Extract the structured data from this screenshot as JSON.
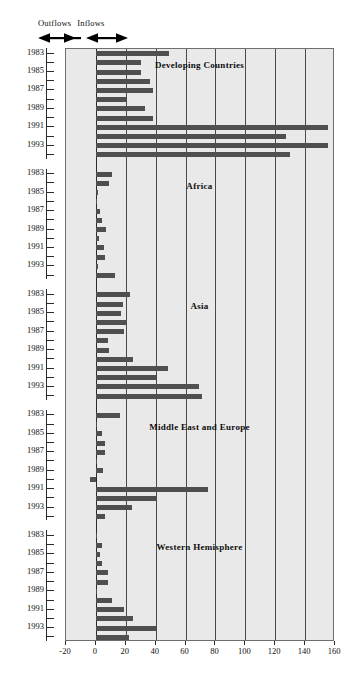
{
  "legend": {
    "outflows_label": "Outflows",
    "inflows_label": "Inflows",
    "left_arrow_icon": "arrow-left-icon",
    "right_arrow_icon": "arrow-right-icon"
  },
  "chart_data": {
    "type": "bar",
    "orientation": "horizontal",
    "title": "",
    "xlabel": "",
    "ylabel": "",
    "xlim": [
      -20,
      160
    ],
    "xticks": [
      -20,
      0,
      20,
      40,
      60,
      80,
      100,
      120,
      140,
      160
    ],
    "xtick_labels": [
      "-20",
      "0",
      "20",
      "40",
      "60",
      "80",
      "100",
      "120",
      "140",
      "160"
    ],
    "grid": true,
    "grid_axis": "x",
    "legend_position": "top-left",
    "bar_color": "#4f4f4f",
    "panel_background": "#e9e9e9",
    "years": [
      1983,
      1984,
      1985,
      1986,
      1987,
      1988,
      1989,
      1990,
      1991,
      1992,
      1993,
      1994
    ],
    "year_tick_labels": [
      "1983",
      "",
      "1985",
      "",
      "1987",
      "",
      "1989",
      "",
      "1991",
      "",
      "1993",
      ""
    ],
    "panels": [
      {
        "name": "Developing Countries",
        "values": [
          49,
          30,
          30,
          36,
          38,
          20,
          33,
          38,
          155,
          127,
          155,
          130
        ]
      },
      {
        "name": "Africa",
        "values": [
          11,
          9,
          1.5,
          1,
          2.5,
          4,
          7,
          2,
          5.5,
          6,
          1.5,
          13
        ]
      },
      {
        "name": "Asia",
        "values": [
          23,
          18,
          17,
          21,
          19,
          8,
          9,
          25,
          48,
          40,
          69,
          71
        ]
      },
      {
        "name": "Middle East and Europe",
        "values": [
          16,
          0.5,
          4,
          6,
          6,
          0,
          5,
          -4,
          75,
          41,
          24,
          6
        ]
      },
      {
        "name": "Western Hemisphere",
        "values": [
          0.5,
          4,
          3,
          4,
          8,
          8,
          1,
          11,
          19,
          25,
          40,
          22
        ]
      }
    ]
  }
}
